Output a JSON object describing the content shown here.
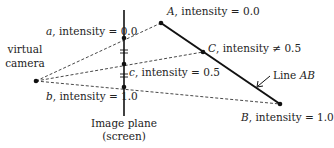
{
  "diagram": {
    "camera": {
      "label_line1": "virtual",
      "label_line2": "camera"
    },
    "image_plane": {
      "label_line1": "Image plane",
      "label_line2": "(screen)"
    },
    "screen_points": {
      "a": {
        "name": "a",
        "text": ", intensity = 0.0"
      },
      "c": {
        "name": "c",
        "text": ", intensity = 0.5"
      },
      "b": {
        "name": "b",
        "text": ", intensity = 1.0"
      }
    },
    "line_points": {
      "A": {
        "name": "A",
        "text": ", intensity = 0.0"
      },
      "C": {
        "name": "C",
        "text": ", intensity ≠ 0.5"
      },
      "B": {
        "name": "B",
        "text": ", intensity = 1.0"
      }
    },
    "line_label": {
      "prefix": "Line ",
      "name": "AB"
    },
    "colors": {
      "ink": "#222222",
      "background": "#ffffff"
    }
  }
}
